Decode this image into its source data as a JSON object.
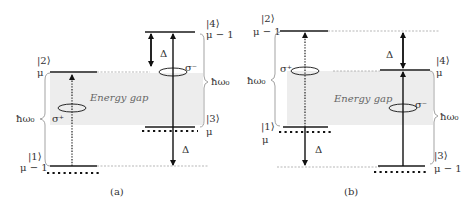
{
  "figure": {
    "panel_a": {
      "caption": "(a)",
      "gap_label": "Energy gap",
      "levels": [
        {
          "id": "ket1",
          "ket": "|1⟩",
          "occupation": "μ − 1"
        },
        {
          "id": "ket2",
          "ket": "|2⟩",
          "occupation": "μ"
        },
        {
          "id": "ket3",
          "ket": "|3⟩",
          "occupation": "μ"
        },
        {
          "id": "ket4",
          "ket": "|4⟩",
          "occupation": "μ − 1"
        }
      ],
      "photon_energy_label": "ħω₀",
      "detuning_label": "Δ",
      "sigma_plus": "σ⁺",
      "sigma_minus": "σ⁻"
    },
    "panel_b": {
      "caption": "(b)",
      "gap_label": "Energy gap",
      "levels": [
        {
          "id": "ket1",
          "ket": "|1⟩",
          "occupation": "μ"
        },
        {
          "id": "ket2",
          "ket": "|2⟩",
          "occupation": "μ − 1"
        },
        {
          "id": "ket3",
          "ket": "|3⟩",
          "occupation": "μ − 1"
        },
        {
          "id": "ket4",
          "ket": "|4⟩",
          "occupation": "μ"
        }
      ],
      "photon_energy_label": "ħω₀",
      "detuning_label": "Δ",
      "sigma_plus": "σ⁺",
      "sigma_minus": "σ⁻"
    }
  }
}
